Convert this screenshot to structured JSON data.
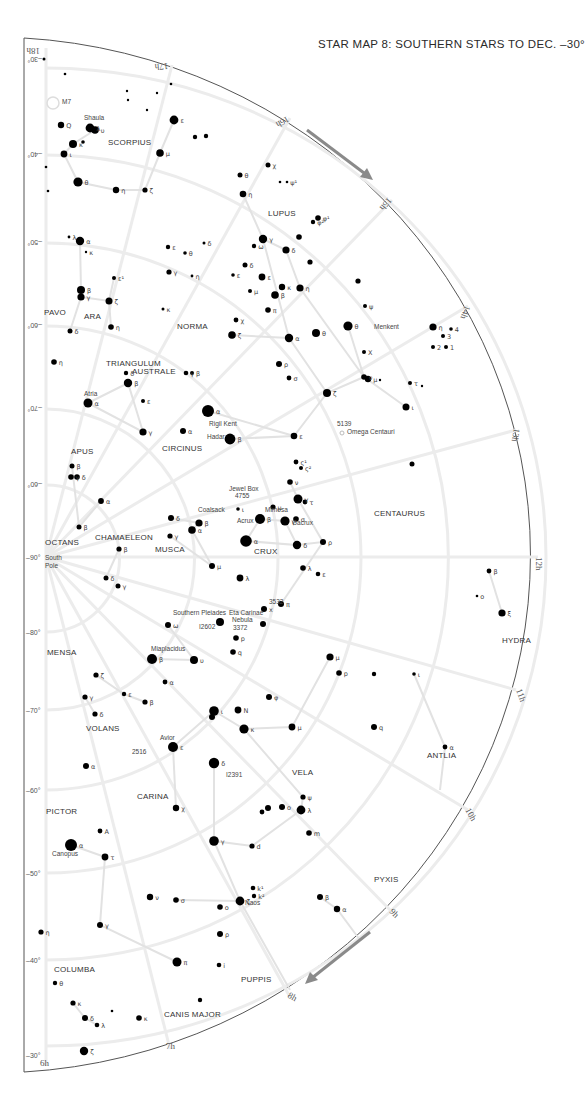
{
  "title": "STAR MAP 8: SOUTHERN STARS TO DEC. –30°",
  "colors": {
    "star": "#000000",
    "grid": "#ececec",
    "constellation_line": "#e2e2e2",
    "arrow": "#8a8a8a",
    "border": "#555555"
  },
  "declination_labels": [
    {
      "text": "–30°",
      "x": 24,
      "y": 60,
      "rot": 180
    },
    {
      "text": "–40°",
      "x": 24,
      "y": 155,
      "rot": 180
    },
    {
      "text": "–50°",
      "x": 24,
      "y": 243,
      "rot": 180
    },
    {
      "text": "–60°",
      "x": 24,
      "y": 326,
      "rot": 180
    },
    {
      "text": "–70°",
      "x": 24,
      "y": 409,
      "rot": 180
    },
    {
      "text": "–60°",
      "x": 24,
      "y": 485,
      "rot": 180
    },
    {
      "text": "–90°",
      "x": 24,
      "y": 557,
      "rot": 0
    },
    {
      "text": "–80°",
      "x": 24,
      "y": 632,
      "rot": 0
    },
    {
      "text": "–70°",
      "x": 24,
      "y": 710,
      "rot": 0
    },
    {
      "text": "–60°",
      "x": 24,
      "y": 790,
      "rot": 0
    },
    {
      "text": "–50°",
      "x": 24,
      "y": 873,
      "rot": 0
    },
    {
      "text": "–40°",
      "x": 24,
      "y": 960,
      "rot": 0
    },
    {
      "text": "–30°",
      "x": 24,
      "y": 1055,
      "rot": 0
    }
  ],
  "hour_labels": [
    {
      "text": "18h",
      "x": 40,
      "y": 48,
      "rot": 180
    },
    {
      "text": "17h",
      "x": 168,
      "y": 63,
      "rot": 175
    },
    {
      "text": "16h",
      "x": 287,
      "y": 116,
      "rot": 150
    },
    {
      "text": "15h",
      "x": 388,
      "y": 197,
      "rot": 130
    },
    {
      "text": "14h",
      "x": 465,
      "y": 305,
      "rot": 110
    },
    {
      "text": "13h",
      "x": 514,
      "y": 428,
      "rot": 100
    },
    {
      "text": "12h",
      "x": 536,
      "y": 557,
      "rot": 90
    },
    {
      "text": "11h",
      "x": 516,
      "y": 690,
      "rot": 70
    },
    {
      "text": "10h",
      "x": 465,
      "y": 810,
      "rot": 60
    },
    {
      "text": "9h",
      "x": 389,
      "y": 912,
      "rot": 45
    },
    {
      "text": "8h",
      "x": 287,
      "y": 997,
      "rot": 30
    },
    {
      "text": "7h",
      "x": 166,
      "y": 1049,
      "rot": 0
    },
    {
      "text": "6h",
      "x": 40,
      "y": 1066,
      "rot": 0
    }
  ],
  "constellations": [
    {
      "name": "SCORPIUS",
      "x": 108,
      "y": 145
    },
    {
      "name": "LUPUS",
      "x": 268,
      "y": 216
    },
    {
      "name": "PAVO",
      "x": 44,
      "y": 315
    },
    {
      "name": "ARA",
      "x": 84,
      "y": 319
    },
    {
      "name": "NORMA",
      "x": 177,
      "y": 329
    },
    {
      "name": "TRIANGULUM",
      "x": 106,
      "y": 366
    },
    {
      "name": "AUSTRALE",
      "x": 132,
      "y": 374
    },
    {
      "name": "APUS",
      "x": 71,
      "y": 454
    },
    {
      "name": "CIRCINUS",
      "x": 162,
      "y": 451
    },
    {
      "name": "CENTAURUS",
      "x": 374,
      "y": 516
    },
    {
      "name": "OCTANS",
      "x": 45,
      "y": 545
    },
    {
      "name": "CHAMAELEON",
      "x": 95,
      "y": 540
    },
    {
      "name": "MUSCA",
      "x": 155,
      "y": 552
    },
    {
      "name": "CRUX",
      "x": 254,
      "y": 554
    },
    {
      "name": "HYDRA",
      "x": 502,
      "y": 643
    },
    {
      "name": "MENSA",
      "x": 47,
      "y": 655
    },
    {
      "name": "VOLANS",
      "x": 86,
      "y": 731
    },
    {
      "name": "ANTLIA",
      "x": 427,
      "y": 758
    },
    {
      "name": "VELA",
      "x": 292,
      "y": 775
    },
    {
      "name": "CARINA",
      "x": 137,
      "y": 799
    },
    {
      "name": "PICTOR",
      "x": 46,
      "y": 814
    },
    {
      "name": "PYXIS",
      "x": 374,
      "y": 882
    },
    {
      "name": "COLUMBA",
      "x": 54,
      "y": 972
    },
    {
      "name": "PUPPIS",
      "x": 241,
      "y": 982
    },
    {
      "name": "CANIS MAJOR",
      "x": 164,
      "y": 1017
    }
  ],
  "named_objects": [
    {
      "text": "Shaula",
      "x": 84,
      "y": 120
    },
    {
      "text": "M7",
      "x": 62,
      "y": 104
    },
    {
      "text": "Menkent",
      "x": 374,
      "y": 329
    },
    {
      "text": "Atria",
      "x": 84,
      "y": 396
    },
    {
      "text": "Rigil Kent",
      "x": 209,
      "y": 426
    },
    {
      "text": "Hadar",
      "x": 207,
      "y": 439
    },
    {
      "text": "5139",
      "x": 337,
      "y": 426
    },
    {
      "text": "Omega Centauri",
      "x": 347,
      "y": 434
    },
    {
      "text": "Jewel Box",
      "x": 229,
      "y": 491
    },
    {
      "text": "4755",
      "x": 235,
      "y": 498
    },
    {
      "text": "Mimosa",
      "x": 265,
      "y": 512
    },
    {
      "text": "Coalsack",
      "x": 198,
      "y": 512
    },
    {
      "text": "Acrux",
      "x": 237,
      "y": 523
    },
    {
      "text": "Gacrux",
      "x": 292,
      "y": 525
    },
    {
      "text": "South",
      "x": 45,
      "y": 560
    },
    {
      "text": "Pole",
      "x": 45,
      "y": 568
    },
    {
      "text": "3532",
      "x": 269,
      "y": 604
    },
    {
      "text": "Southern Pleiades",
      "x": 173,
      "y": 615
    },
    {
      "text": "Eta Carinae",
      "x": 229,
      "y": 615
    },
    {
      "text": "Nebula",
      "x": 232,
      "y": 622
    },
    {
      "text": "3372",
      "x": 233,
      "y": 630
    },
    {
      "text": "I2602",
      "x": 199,
      "y": 629
    },
    {
      "text": "Miaplacidus",
      "x": 151,
      "y": 651
    },
    {
      "text": "Avior",
      "x": 160,
      "y": 740
    },
    {
      "text": "2516",
      "x": 132,
      "y": 754
    },
    {
      "text": "I2391",
      "x": 226,
      "y": 777
    },
    {
      "text": "Canopus",
      "x": 52,
      "y": 856
    },
    {
      "text": "Naos",
      "x": 245,
      "y": 905
    }
  ],
  "stars": [
    {
      "x": 44,
      "y": 59,
      "r": 1.5
    },
    {
      "x": 65,
      "y": 74,
      "r": 1.3
    },
    {
      "x": 61,
      "y": 125,
      "r": 3.2,
      "l": "Q"
    },
    {
      "x": 90,
      "y": 128,
      "r": 4.4,
      "l": "λ"
    },
    {
      "x": 95,
      "y": 130,
      "r": 3.8,
      "l": "υ"
    },
    {
      "x": 73,
      "y": 144,
      "r": 4.0,
      "l": "κ"
    },
    {
      "x": 83,
      "y": 142,
      "r": 1.8
    },
    {
      "x": 64,
      "y": 154,
      "r": 3.4,
      "l": "ι"
    },
    {
      "x": 78,
      "y": 182,
      "r": 4.6,
      "l": "θ"
    },
    {
      "x": 116,
      "y": 190,
      "r": 3.2,
      "l": "η"
    },
    {
      "x": 145,
      "y": 190,
      "r": 2.6,
      "l": "ζ"
    },
    {
      "x": 174,
      "y": 120,
      "r": 4.4,
      "l": "ε"
    },
    {
      "x": 160,
      "y": 153,
      "r": 3.8,
      "l": "μ"
    },
    {
      "x": 171,
      "y": 84,
      "r": 1.3
    },
    {
      "x": 127,
      "y": 91,
      "r": 1.2
    },
    {
      "x": 157,
      "y": 93,
      "r": 1.2
    },
    {
      "x": 128,
      "y": 100,
      "r": 1.2
    },
    {
      "x": 147,
      "y": 110,
      "r": 1.2
    },
    {
      "x": 195,
      "y": 137,
      "r": 2.2
    },
    {
      "x": 206,
      "y": 136,
      "r": 2.2
    },
    {
      "x": 46,
      "y": 167,
      "r": 1.3
    },
    {
      "x": 48,
      "y": 191,
      "r": 1.3
    },
    {
      "x": 240,
      "y": 175,
      "r": 2.5,
      "l": "θ"
    },
    {
      "x": 243,
      "y": 194,
      "r": 3.3,
      "l": "η"
    },
    {
      "x": 268,
      "y": 165,
      "r": 2.5,
      "l": "χ"
    },
    {
      "x": 287,
      "y": 182,
      "r": 1.3,
      "l": "ψ¹"
    },
    {
      "x": 280,
      "y": 182,
      "r": 1.3
    },
    {
      "x": 318,
      "y": 218,
      "r": 2.8,
      "l": "φ¹"
    },
    {
      "x": 313,
      "y": 222,
      "r": 2.2,
      "l": "φ²"
    },
    {
      "x": 263,
      "y": 239,
      "r": 4.2,
      "l": "γ"
    },
    {
      "x": 254,
      "y": 246,
      "r": 2.2,
      "l": "ω"
    },
    {
      "x": 286,
      "y": 250,
      "r": 3.6,
      "l": "δ"
    },
    {
      "x": 262,
      "y": 277,
      "r": 3.4,
      "l": "ε"
    },
    {
      "x": 282,
      "y": 287,
      "r": 3.2,
      "l": "κ"
    },
    {
      "x": 275,
      "y": 295,
      "r": 3.8,
      "l": "β"
    },
    {
      "x": 268,
      "y": 310,
      "r": 2.8,
      "l": "π"
    },
    {
      "x": 233,
      "y": 275,
      "r": 1.8,
      "l": "ε"
    },
    {
      "x": 245,
      "y": 265,
      "r": 2.5,
      "l": "δ"
    },
    {
      "x": 250,
      "y": 291,
      "r": 2.0,
      "l": "μ"
    },
    {
      "x": 80,
      "y": 241,
      "r": 4.2,
      "l": "α"
    },
    {
      "x": 69,
      "y": 237,
      "r": 1.4,
      "l": "λ"
    },
    {
      "x": 86,
      "y": 252,
      "r": 1.2,
      "l": "κ"
    },
    {
      "x": 81,
      "y": 290,
      "r": 4.0,
      "l": "β"
    },
    {
      "x": 81,
      "y": 297,
      "r": 3.6,
      "l": "γ"
    },
    {
      "x": 109,
      "y": 301,
      "r": 3.5,
      "l": "ζ"
    },
    {
      "x": 114,
      "y": 278,
      "r": 2.0,
      "l": "ε¹"
    },
    {
      "x": 111,
      "y": 327,
      "r": 2.8,
      "l": "η"
    },
    {
      "x": 70,
      "y": 331,
      "r": 2.5,
      "l": "δ"
    },
    {
      "x": 54,
      "y": 362,
      "r": 2.8,
      "l": "η"
    },
    {
      "x": 169,
      "y": 272,
      "r": 2.6,
      "l": "γ"
    },
    {
      "x": 192,
      "y": 276,
      "r": 1.4,
      "l": "η"
    },
    {
      "x": 168,
      "y": 247,
      "r": 2.2,
      "l": "ε"
    },
    {
      "x": 185,
      "y": 253,
      "r": 1.8,
      "l": "θ"
    },
    {
      "x": 204,
      "y": 243,
      "r": 1.5,
      "l": "δ"
    },
    {
      "x": 163,
      "y": 309,
      "r": 1.5,
      "l": "κ"
    },
    {
      "x": 232,
      "y": 335,
      "r": 3.8,
      "l": "ζ"
    },
    {
      "x": 279,
      "y": 364,
      "r": 3.0,
      "l": "ρ"
    },
    {
      "x": 289,
      "y": 378,
      "r": 2.4,
      "l": "σ"
    },
    {
      "x": 289,
      "y": 338,
      "r": 4.2,
      "l": "α"
    },
    {
      "x": 236,
      "y": 320,
      "r": 2.4,
      "l": "χ"
    },
    {
      "x": 128,
      "y": 383,
      "r": 4.2,
      "l": "β"
    },
    {
      "x": 126,
      "y": 373,
      "r": 2.2,
      "l": "δ"
    },
    {
      "x": 186,
      "y": 373,
      "r": 2.3,
      "l": "γ"
    },
    {
      "x": 192,
      "y": 373,
      "r": 2.0,
      "l": "β"
    },
    {
      "x": 88,
      "y": 403,
      "r": 4.5,
      "l": "α"
    },
    {
      "x": 143,
      "y": 401,
      "r": 2.0,
      "l": "ε"
    },
    {
      "x": 143,
      "y": 432,
      "r": 3.6,
      "l": "γ"
    },
    {
      "x": 183,
      "y": 431,
      "r": 3.0,
      "l": "α"
    },
    {
      "x": 208,
      "y": 411,
      "r": 6.0,
      "l": "α"
    },
    {
      "x": 230,
      "y": 439,
      "r": 5.4,
      "l": "β"
    },
    {
      "x": 294,
      "y": 436,
      "r": 3.3,
      "l": "ε"
    },
    {
      "x": 300,
      "y": 288,
      "r": 3.6,
      "l": "η"
    },
    {
      "x": 316,
      "y": 333,
      "r": 4.0,
      "l": "θ"
    },
    {
      "x": 365,
      "y": 306,
      "r": 2.0,
      "l": "ψ"
    },
    {
      "x": 348,
      "y": 326,
      "r": 4.6,
      "l": "θ"
    },
    {
      "x": 364,
      "y": 352,
      "r": 2.0,
      "l": "Χ"
    },
    {
      "x": 364,
      "y": 377,
      "r": 2.8,
      "l": "ν"
    },
    {
      "x": 368,
      "y": 379,
      "r": 3.2,
      "l": "μ"
    },
    {
      "x": 327,
      "y": 393,
      "r": 4.0,
      "l": "ζ"
    },
    {
      "x": 406,
      "y": 407,
      "r": 3.5,
      "l": "ι"
    },
    {
      "x": 410,
      "y": 383,
      "r": 2.0,
      "l": "τ"
    },
    {
      "x": 433,
      "y": 327,
      "r": 3.6,
      "l": "η"
    },
    {
      "x": 433,
      "y": 347,
      "r": 2.0,
      "l": "2"
    },
    {
      "x": 446,
      "y": 347,
      "r": 2.0,
      "l": "1"
    },
    {
      "x": 443,
      "y": 336,
      "r": 2.0,
      "l": "3"
    },
    {
      "x": 451,
      "y": 329,
      "r": 1.8,
      "l": "4"
    },
    {
      "x": 299,
      "y": 237,
      "r": 2.8
    },
    {
      "x": 310,
      "y": 262,
      "r": 2.6
    },
    {
      "x": 358,
      "y": 281,
      "r": 2.6
    },
    {
      "x": 380,
      "y": 380,
      "r": 1.2
    },
    {
      "x": 422,
      "y": 386,
      "r": 1.2
    },
    {
      "x": 296,
      "y": 462,
      "r": 2.4,
      "l": "ς¹"
    },
    {
      "x": 301,
      "y": 468,
      "r": 2.0,
      "l": "ς²"
    },
    {
      "x": 290,
      "y": 482,
      "r": 2.8,
      "l": "ν"
    },
    {
      "x": 298,
      "y": 499,
      "r": 4.5,
      "l": "γ"
    },
    {
      "x": 305,
      "y": 502,
      "r": 2.4,
      "l": "τ"
    },
    {
      "x": 296,
      "y": 519,
      "r": 2.8,
      "l": "σ"
    },
    {
      "x": 260,
      "y": 519,
      "r": 5.0,
      "l": "β"
    },
    {
      "x": 285,
      "y": 521,
      "r": 4.6,
      "l": "γ"
    },
    {
      "x": 246,
      "y": 541,
      "r": 5.8,
      "l": "α"
    },
    {
      "x": 297,
      "y": 545,
      "r": 4.2,
      "l": "δ"
    },
    {
      "x": 323,
      "y": 542,
      "r": 3.0,
      "l": "ρ"
    },
    {
      "x": 303,
      "y": 568,
      "r": 2.8,
      "l": "λ"
    },
    {
      "x": 318,
      "y": 574,
      "r": 2.3,
      "l": "ε"
    },
    {
      "x": 281,
      "y": 604,
      "r": 3.0,
      "l": "π"
    },
    {
      "x": 489,
      "y": 571,
      "r": 2.4,
      "l": "β"
    },
    {
      "x": 502,
      "y": 613,
      "r": 3.6,
      "l": "ξ"
    },
    {
      "x": 477,
      "y": 596,
      "r": 1.3,
      "l": "o"
    },
    {
      "x": 412,
      "y": 464,
      "r": 2.5
    },
    {
      "x": 101,
      "y": 501,
      "r": 2.9,
      "l": "α"
    },
    {
      "x": 79,
      "y": 527,
      "r": 2.5,
      "l": "β"
    },
    {
      "x": 72,
      "y": 466,
      "r": 2.5,
      "l": "β"
    },
    {
      "x": 71,
      "y": 477,
      "r": 2.8,
      "l": "γ"
    },
    {
      "x": 77,
      "y": 477,
      "r": 2.8,
      "l": "δ"
    },
    {
      "x": 171,
      "y": 518,
      "r": 3.0,
      "l": "δ"
    },
    {
      "x": 199,
      "y": 523,
      "r": 3.6,
      "l": "β"
    },
    {
      "x": 192,
      "y": 530,
      "r": 3.8,
      "l": "α"
    },
    {
      "x": 170,
      "y": 536,
      "r": 2.6,
      "l": "γ"
    },
    {
      "x": 119,
      "y": 549,
      "r": 2.6,
      "l": "β"
    },
    {
      "x": 106,
      "y": 578,
      "r": 2.5,
      "l": "δ"
    },
    {
      "x": 118,
      "y": 586,
      "r": 2.5,
      "l": "γ"
    },
    {
      "x": 212,
      "y": 566,
      "r": 3.0,
      "l": "μ"
    },
    {
      "x": 240,
      "y": 578,
      "r": 3.4,
      "l": "λ"
    },
    {
      "x": 238,
      "y": 509,
      "r": 1.8,
      "l": "ι"
    },
    {
      "x": 273,
      "y": 507,
      "r": 2.6,
      "l": "μ"
    },
    {
      "x": 168,
      "y": 625,
      "r": 3.0,
      "l": "ω"
    },
    {
      "x": 220,
      "y": 622,
      "r": 4.0
    },
    {
      "x": 264,
      "y": 609,
      "r": 3.0,
      "l": "x"
    },
    {
      "x": 236,
      "y": 638,
      "r": 2.8,
      "l": "p"
    },
    {
      "x": 263,
      "y": 624,
      "r": 3.0
    },
    {
      "x": 233,
      "y": 652,
      "r": 2.8,
      "l": "q"
    },
    {
      "x": 152,
      "y": 659,
      "r": 5.0,
      "l": "β"
    },
    {
      "x": 194,
      "y": 660,
      "r": 4.0,
      "l": "υ"
    },
    {
      "x": 165,
      "y": 682,
      "r": 2.4,
      "l": "α"
    },
    {
      "x": 96,
      "y": 675,
      "r": 2.6,
      "l": "ζ"
    },
    {
      "x": 124,
      "y": 694,
      "r": 2.2,
      "l": "ε"
    },
    {
      "x": 85,
      "y": 697,
      "r": 2.6,
      "l": "γ"
    },
    {
      "x": 145,
      "y": 702,
      "r": 2.6,
      "l": "β"
    },
    {
      "x": 95,
      "y": 714,
      "r": 2.6,
      "l": "δ"
    },
    {
      "x": 214,
      "y": 711,
      "r": 4.8,
      "l": "ι"
    },
    {
      "x": 212,
      "y": 717,
      "r": 3.0
    },
    {
      "x": 238,
      "y": 710,
      "r": 3.4,
      "l": "N"
    },
    {
      "x": 244,
      "y": 729,
      "r": 4.6,
      "l": "κ"
    },
    {
      "x": 269,
      "y": 697,
      "r": 3.0,
      "l": "φ"
    },
    {
      "x": 173,
      "y": 747,
      "r": 5.0,
      "l": "ε"
    },
    {
      "x": 214,
      "y": 763,
      "r": 5.2,
      "l": "δ"
    },
    {
      "x": 292,
      "y": 727,
      "r": 3.4,
      "l": "μ"
    },
    {
      "x": 330,
      "y": 657,
      "r": 3.6,
      "l": "μ"
    },
    {
      "x": 339,
      "y": 673,
      "r": 2.8,
      "l": "p"
    },
    {
      "x": 374,
      "y": 727,
      "r": 3.0,
      "l": "q"
    },
    {
      "x": 374,
      "y": 674,
      "r": 2.2
    },
    {
      "x": 445,
      "y": 747,
      "r": 2.4,
      "l": "α"
    },
    {
      "x": 414,
      "y": 674,
      "r": 1.8,
      "l": "ι"
    },
    {
      "x": 86,
      "y": 766,
      "r": 3.0,
      "l": "α"
    },
    {
      "x": 176,
      "y": 808,
      "r": 3.2,
      "l": "χ"
    },
    {
      "x": 282,
      "y": 807,
      "r": 3.0,
      "l": "ο"
    },
    {
      "x": 303,
      "y": 797,
      "r": 2.6,
      "l": "ψ"
    },
    {
      "x": 301,
      "y": 810,
      "r": 4.4,
      "l": "λ"
    },
    {
      "x": 309,
      "y": 833,
      "r": 2.8,
      "l": "m"
    },
    {
      "x": 262,
      "y": 812,
      "r": 2.4
    },
    {
      "x": 268,
      "y": 808,
      "r": 3.0
    },
    {
      "x": 214,
      "y": 841,
      "r": 4.8,
      "l": "γ"
    },
    {
      "x": 252,
      "y": 846,
      "r": 2.6,
      "l": "d"
    },
    {
      "x": 71,
      "y": 845,
      "r": 6.0,
      "l": "α"
    },
    {
      "x": 100,
      "y": 831,
      "r": 2.4,
      "l": "A"
    },
    {
      "x": 105,
      "y": 857,
      "r": 3.4,
      "l": "τ"
    },
    {
      "x": 176,
      "y": 900,
      "r": 2.8,
      "l": "σ"
    },
    {
      "x": 150,
      "y": 897,
      "r": 3.2,
      "l": "ν"
    },
    {
      "x": 240,
      "y": 901,
      "r": 4.4,
      "l": "ζ"
    },
    {
      "x": 220,
      "y": 907,
      "r": 2.8,
      "l": "o"
    },
    {
      "x": 253,
      "y": 888,
      "r": 2.3,
      "l": "k¹"
    },
    {
      "x": 254,
      "y": 896,
      "r": 2.2,
      "l": "k²"
    },
    {
      "x": 100,
      "y": 925,
      "r": 3.0,
      "l": "γ"
    },
    {
      "x": 41,
      "y": 932,
      "r": 2.6,
      "l": "η"
    },
    {
      "x": 220,
      "y": 934,
      "r": 3.0,
      "l": "ρ"
    },
    {
      "x": 177,
      "y": 962,
      "r": 4.5,
      "l": "π"
    },
    {
      "x": 219,
      "y": 965,
      "r": 2.3,
      "l": "i"
    },
    {
      "x": 320,
      "y": 897,
      "r": 3.0,
      "l": "β"
    },
    {
      "x": 337,
      "y": 909,
      "r": 3.2,
      "l": "α"
    },
    {
      "x": 73,
      "y": 1003,
      "r": 2.6,
      "l": "κ"
    },
    {
      "x": 85,
      "y": 1018,
      "r": 3.0,
      "l": "δ"
    },
    {
      "x": 97,
      "y": 1025,
      "r": 2.3,
      "l": "λ"
    },
    {
      "x": 139,
      "y": 1018,
      "r": 2.8,
      "l": "κ"
    },
    {
      "x": 84,
      "y": 1051,
      "r": 4.2,
      "l": "ζ"
    },
    {
      "x": 55,
      "y": 983,
      "r": 2.2,
      "l": "θ"
    },
    {
      "x": 112,
      "y": 1011,
      "r": 1.3
    },
    {
      "x": 200,
      "y": 1000,
      "r": 2.2
    }
  ]
}
